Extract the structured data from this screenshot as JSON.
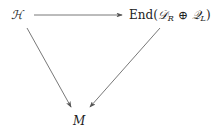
{
  "diagram": {
    "type": "commutative-diagram",
    "nodes": {
      "source": {
        "label": "ℋ"
      },
      "target": {
        "prefix": "End(",
        "d": "𝒟",
        "d_sub": "R",
        "op": " ⊕ ",
        "q": "𝒬",
        "q_sub": "L",
        "suffix": ")"
      },
      "bottom": {
        "label": "M"
      }
    },
    "edges": [
      {
        "from": "source",
        "to": "target"
      },
      {
        "from": "source",
        "to": "bottom"
      },
      {
        "from": "target",
        "to": "bottom"
      }
    ],
    "colors": {
      "text": "#222222",
      "arrow": "#555555"
    }
  }
}
